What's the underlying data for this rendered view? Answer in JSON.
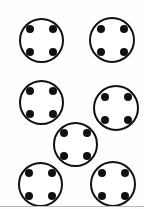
{
  "scene": {
    "title": "Sewing buttons illustration",
    "background_color": "#fefefe",
    "width": 144,
    "height": 209,
    "outline_color": "#111111",
    "hole_color": "#111111",
    "button_face_color": "#ffffff",
    "ring_stroke_px": 2,
    "button_count": 7,
    "holes_per_button": 4
  },
  "bottom_rule": {
    "color": "#b9b9b9",
    "top": 206,
    "height": 1
  },
  "buttons": [
    {
      "name": "button-top-left",
      "row": "top",
      "column": "left",
      "left": 19,
      "top": 18,
      "size": 45,
      "hole_size": 8,
      "hole_gap": 4,
      "holes": 4
    },
    {
      "name": "button-top-right",
      "row": "top",
      "column": "right",
      "left": 89,
      "top": 17,
      "size": 46,
      "hole_size": 8,
      "hole_gap": 4,
      "holes": 4
    },
    {
      "name": "button-middle-left",
      "row": "middle",
      "column": "left",
      "left": 19,
      "top": 80,
      "size": 45,
      "hole_size": 8,
      "hole_gap": 4,
      "holes": 4
    },
    {
      "name": "button-middle-right",
      "row": "middle",
      "column": "right",
      "left": 93,
      "top": 85,
      "size": 46,
      "hole_size": 8,
      "hole_gap": 4,
      "holes": 4
    },
    {
      "name": "button-center",
      "row": "center",
      "column": "center",
      "left": 53,
      "top": 122,
      "size": 45,
      "hole_size": 8,
      "hole_gap": 4,
      "holes": 4
    },
    {
      "name": "button-bottom-left",
      "row": "bottom",
      "column": "left",
      "left": 18,
      "top": 162,
      "size": 45,
      "hole_size": 8,
      "hole_gap": 4,
      "holes": 4
    },
    {
      "name": "button-bottom-right",
      "row": "bottom",
      "column": "right",
      "left": 90,
      "top": 161,
      "size": 46,
      "hole_size": 8,
      "hole_gap": 4,
      "holes": 4
    }
  ]
}
